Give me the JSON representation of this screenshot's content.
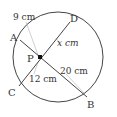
{
  "figure": {
    "colors": {
      "stroke": "#444444",
      "text": "#333333",
      "leader": "#bbbbbb",
      "background": "#ffffff"
    },
    "circle": {
      "cx": 58,
      "cy": 57,
      "r": 45
    },
    "points": {
      "A": {
        "label": "A",
        "x": 20,
        "y": 40
      },
      "B": {
        "label": "B",
        "x": 87,
        "y": 97
      },
      "C": {
        "label": "C",
        "x": 19,
        "y": 86
      },
      "D": {
        "label": "D",
        "x": 70,
        "y": 22
      },
      "P": {
        "label": "P",
        "x": 40,
        "y": 57
      }
    },
    "segments": {
      "AP": "9 cm",
      "PD": "x cm",
      "CP": "12 cm",
      "PB": "20 cm"
    }
  }
}
